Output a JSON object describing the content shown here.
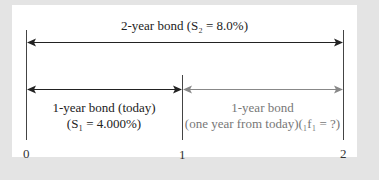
{
  "diagram": {
    "top_label": "2-year bond (S₂ = 8.0%)",
    "left_label_line1": "1-year bond (today)",
    "left_label_line2": "(S₁ = 4.000%)",
    "right_label_line1": "1-year bond",
    "right_label_line2": "(one year from today)(₁f₁ = ?)",
    "ticks": [
      "0",
      "1",
      "2"
    ],
    "colors": {
      "background": "#e4e4e4",
      "panel": "#ffffff",
      "dark_arrow": "#222222",
      "gray_arrow": "#888888"
    }
  }
}
